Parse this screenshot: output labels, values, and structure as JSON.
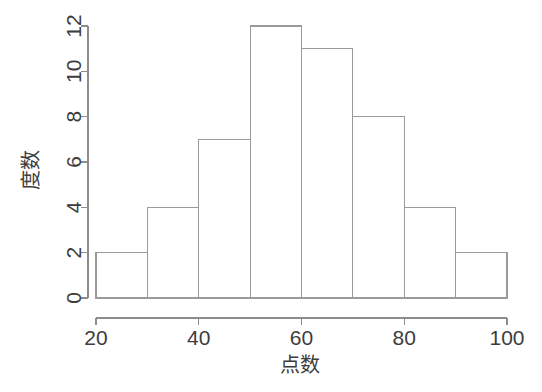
{
  "chart_data": {
    "type": "bar",
    "title": "",
    "subtitle": "",
    "xlabel": "点数",
    "ylabel": "度数",
    "categories": [
      "20-30",
      "30-40",
      "40-50",
      "50-60",
      "60-70",
      "70-80",
      "80-90",
      "90-100"
    ],
    "bin_edges": [
      20,
      30,
      40,
      50,
      60,
      70,
      80,
      90,
      100
    ],
    "values": [
      2,
      4,
      7,
      12,
      11,
      8,
      4,
      2
    ],
    "xlim": [
      20,
      100
    ],
    "ylim": [
      0,
      12
    ],
    "x_ticks": [
      20,
      40,
      60,
      80,
      100
    ],
    "x_tick_labels": [
      "20",
      "40",
      "60",
      "80",
      "100"
    ],
    "y_ticks": [
      0,
      2,
      4,
      6,
      8,
      10,
      12
    ],
    "y_tick_labels": [
      "0",
      "2",
      "4",
      "6",
      "8",
      "10",
      "12"
    ],
    "grid": false,
    "legend": null,
    "bar_fill_color": "#ffffff",
    "bar_border_color": "#9a9a9a",
    "axis_color": "#8c8c8c",
    "background_color": "#ffffff",
    "text_color": "#3d3d3d"
  },
  "axes": {
    "y_title": "度数",
    "x_title": "点数"
  }
}
